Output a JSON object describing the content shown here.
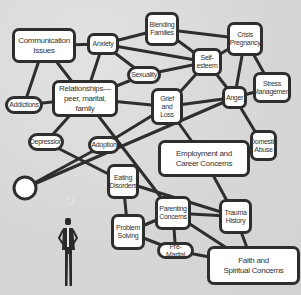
{
  "diagram": {
    "background_color": "#d9d9d9",
    "line_color": "#2e2e2e",
    "node_fill": "#ffffff",
    "text_color": "#333333",
    "nodes": [
      {
        "id": "communication",
        "label": "Communication\nIssues",
        "x": 12,
        "y": 28,
        "w": 64,
        "h": 35,
        "style": "large"
      },
      {
        "id": "anxiety",
        "label": "Anxiety",
        "x": 87,
        "y": 33,
        "w": 32,
        "h": 22,
        "style": ""
      },
      {
        "id": "blending",
        "label": "Blending\nFamilies",
        "x": 145,
        "y": 12,
        "w": 34,
        "h": 34,
        "style": ""
      },
      {
        "id": "crisis",
        "label": "Crisis\nPregnancy",
        "x": 227,
        "y": 22,
        "w": 36,
        "h": 34,
        "style": ""
      },
      {
        "id": "selfesteem",
        "label": "Self-\nesteem",
        "x": 192,
        "y": 48,
        "w": 30,
        "h": 28,
        "style": ""
      },
      {
        "id": "sexuality",
        "label": "Sexuality",
        "x": 127,
        "y": 66,
        "w": 34,
        "h": 18,
        "style": "pill"
      },
      {
        "id": "stress",
        "label": "Stress\nManagement",
        "x": 253,
        "y": 72,
        "w": 38,
        "h": 31,
        "style": ""
      },
      {
        "id": "relationships",
        "label": "Relationships—\npeer, marital, family",
        "x": 52,
        "y": 80,
        "w": 66,
        "h": 37,
        "style": "large"
      },
      {
        "id": "grief",
        "label": "Grief\nand\nLoss",
        "x": 151,
        "y": 88,
        "w": 32,
        "h": 37,
        "style": ""
      },
      {
        "id": "anger",
        "label": "Anger",
        "x": 222,
        "y": 86,
        "w": 25,
        "h": 23,
        "style": ""
      },
      {
        "id": "addictions",
        "label": "Addictions",
        "x": 5,
        "y": 96,
        "w": 38,
        "h": 18,
        "style": "pill"
      },
      {
        "id": "depression",
        "label": "Depression",
        "x": 28,
        "y": 133,
        "w": 36,
        "h": 18,
        "style": "pill"
      },
      {
        "id": "adoption",
        "label": "Adoption",
        "x": 88,
        "y": 136,
        "w": 32,
        "h": 18,
        "style": "pill"
      },
      {
        "id": "domestic",
        "label": "Domestic\nAbuse",
        "x": 250,
        "y": 130,
        "w": 27,
        "h": 31,
        "style": ""
      },
      {
        "id": "employment",
        "label": "Employment and\nCareer Concerns",
        "x": 158,
        "y": 140,
        "w": 92,
        "h": 37,
        "style": "large"
      },
      {
        "id": "eating",
        "label": "Eating\nDisorders",
        "x": 107,
        "y": 164,
        "w": 32,
        "h": 35,
        "style": ""
      },
      {
        "id": "parenting",
        "label": "Parenting\nConcerns",
        "x": 155,
        "y": 196,
        "w": 36,
        "h": 34,
        "style": ""
      },
      {
        "id": "trauma",
        "label": "Trauma\nHistory",
        "x": 219,
        "y": 199,
        "w": 33,
        "h": 35,
        "style": ""
      },
      {
        "id": "problem",
        "label": "Problem\nSolving",
        "x": 111,
        "y": 214,
        "w": 34,
        "h": 36,
        "style": ""
      },
      {
        "id": "premarital",
        "label": "Pre-Marital",
        "x": 157,
        "y": 242,
        "w": 37,
        "h": 17,
        "style": "pill"
      },
      {
        "id": "faith",
        "label": "Faith and\nSpiritual Concerns",
        "x": 207,
        "y": 246,
        "w": 93,
        "h": 39,
        "style": "large"
      }
    ],
    "start_circle": {
      "cx": 25,
      "cy": 188,
      "r": 11
    },
    "edges": [
      [
        "communication",
        "anxiety"
      ],
      [
        "communication",
        "addictions"
      ],
      [
        "communication",
        "relationships"
      ],
      [
        "addictions",
        "relationships"
      ],
      [
        "anxiety",
        "relationships"
      ],
      [
        "anxiety",
        "blending"
      ],
      [
        "anxiety",
        "selfesteem"
      ],
      [
        "anxiety",
        "sexuality"
      ],
      [
        "blending",
        "crisis"
      ],
      [
        "blending",
        "selfesteem"
      ],
      [
        "crisis",
        "selfesteem"
      ],
      [
        "crisis",
        "anger"
      ],
      [
        "crisis",
        "stress"
      ],
      [
        "sexuality",
        "selfesteem"
      ],
      [
        "sexuality",
        "relationships"
      ],
      [
        "selfesteem",
        "grief"
      ],
      [
        "selfesteem",
        "anger"
      ],
      [
        "relationships",
        "grief"
      ],
      [
        "relationships",
        "depression"
      ],
      [
        "relationships",
        "parenting"
      ],
      [
        "grief",
        "anger"
      ],
      [
        "grief",
        "employment"
      ],
      [
        "anger",
        "stress"
      ],
      [
        "anger",
        "domestic"
      ],
      [
        "adoption",
        "grief"
      ],
      [
        "employment",
        "domestic"
      ],
      [
        "employment",
        "trauma"
      ],
      [
        "depression",
        "eating"
      ],
      [
        "eating",
        "trauma"
      ],
      [
        "eating",
        "problem"
      ],
      [
        "parenting",
        "trauma"
      ],
      [
        "parenting",
        "problem"
      ],
      [
        "parenting",
        "premarital"
      ],
      [
        "parenting",
        "faith"
      ],
      [
        "problem",
        "premarital"
      ],
      [
        "premarital",
        "faith"
      ],
      [
        "trauma",
        "faith"
      ]
    ],
    "circle_edges": [
      {
        "to": "adoption"
      },
      {
        "to": "anger"
      }
    ],
    "figure": {
      "label": "?",
      "description": "person-with-question-mark"
    }
  }
}
